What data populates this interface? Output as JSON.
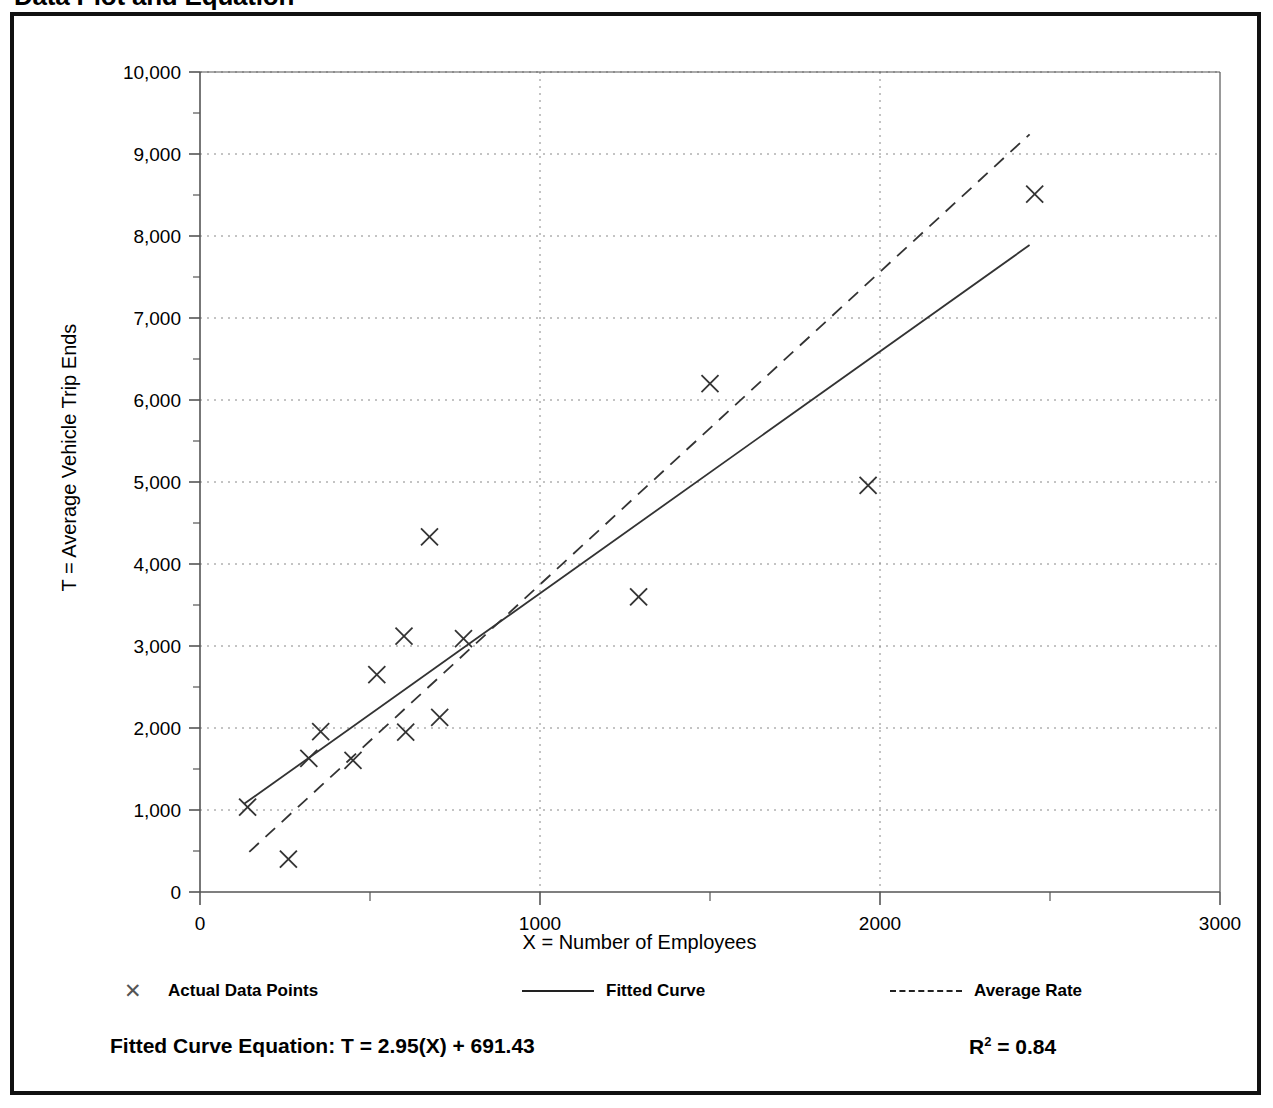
{
  "title": "Data Plot and Equation",
  "axes": {
    "x_title": "X = Number of Employees",
    "y_title": "T = Average Vehicle Trip Ends"
  },
  "legend": [
    {
      "label": "Actual Data Points",
      "marker": "x-marker",
      "glyph": "✕"
    },
    {
      "label": "Fitted Curve",
      "marker": "solid-line"
    },
    {
      "label": "Average Rate",
      "marker": "dashed-line"
    }
  ],
  "equation": {
    "fitted_curve": "Fitted Curve Equation:  T = 2.95(X) + 691.43",
    "r_squared_prefix": "R",
    "r_squared_exponent": "2",
    "r_squared_value": " = 0.84"
  },
  "colors": {
    "frame": "#111111",
    "axis": "#555555",
    "grid": "#888888",
    "marker": "#333333",
    "fitted_curve": "#333333",
    "average_rate": "#333333",
    "background": "#ffffff"
  },
  "chart_data": {
    "type": "scatter",
    "title": "Data Plot and Equation",
    "xlabel": "X = Number of Employees",
    "ylabel": "T = Average Vehicle Trip Ends",
    "xlim": [
      0,
      3000
    ],
    "ylim": [
      0,
      10000
    ],
    "x_ticks": [
      0,
      1000,
      2000,
      3000
    ],
    "x_tick_labels": [
      "0",
      "1000",
      "2000",
      "3000"
    ],
    "x_minor_ticks": [
      500,
      1500,
      2500
    ],
    "y_ticks": [
      0,
      1000,
      2000,
      3000,
      4000,
      5000,
      6000,
      7000,
      8000,
      9000,
      10000
    ],
    "y_tick_labels": [
      "0",
      "1,000",
      "2,000",
      "3,000",
      "4,000",
      "5,000",
      "6,000",
      "7,000",
      "8,000",
      "9,000",
      "10,000"
    ],
    "y_minor_ticks": [
      500,
      1500,
      2500,
      3500,
      4500,
      5500,
      6500,
      7500,
      8500,
      9500
    ],
    "grid": {
      "horizontal": "dotted",
      "vertical": "dotted",
      "vertical_at": [
        1000,
        2000
      ]
    },
    "legend_position": "below-axis",
    "series": [
      {
        "name": "Actual Data Points",
        "type": "scatter",
        "marker": "x",
        "points": [
          {
            "x": 140,
            "y": 1035
          },
          {
            "x": 260,
            "y": 400
          },
          {
            "x": 320,
            "y": 1630
          },
          {
            "x": 355,
            "y": 1955
          },
          {
            "x": 450,
            "y": 1605
          },
          {
            "x": 520,
            "y": 2650
          },
          {
            "x": 600,
            "y": 3120
          },
          {
            "x": 605,
            "y": 1950
          },
          {
            "x": 675,
            "y": 4330
          },
          {
            "x": 705,
            "y": 2130
          },
          {
            "x": 775,
            "y": 3090
          },
          {
            "x": 1290,
            "y": 3600
          },
          {
            "x": 1500,
            "y": 6200
          },
          {
            "x": 1965,
            "y": 4960
          },
          {
            "x": 2455,
            "y": 8510
          }
        ]
      },
      {
        "name": "Fitted Curve",
        "type": "line",
        "style": "solid",
        "equation": "T = 2.95(X) + 691.43",
        "slope": 2.95,
        "intercept": 691.43,
        "r_squared": 0.84,
        "endpoints": [
          {
            "x": 130,
            "y": 1075
          },
          {
            "x": 2440,
            "y": 7890
          }
        ]
      },
      {
        "name": "Average Rate",
        "type": "line",
        "style": "dashed",
        "endpoints": [
          {
            "x": 145,
            "y": 490
          },
          {
            "x": 2440,
            "y": 9240
          }
        ]
      }
    ]
  }
}
